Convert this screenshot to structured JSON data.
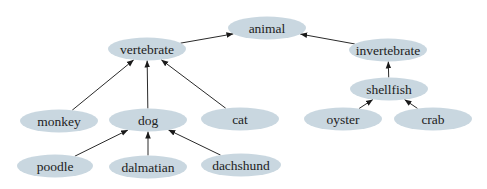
{
  "diagram": {
    "type": "tree",
    "direction": "child-to-parent arrows",
    "colors": {
      "node_fill": "#c9d7e0",
      "edge": "#2a2a2a",
      "text": "#222222",
      "background": "#ffffff"
    },
    "nodes": {
      "animal": {
        "label": "animal",
        "cx": 267,
        "cy": 28,
        "rx": 39,
        "ry": 11.5
      },
      "vertebrate": {
        "label": "vertebrate",
        "cx": 147,
        "cy": 49,
        "rx": 39,
        "ry": 11.5
      },
      "invertebrate": {
        "label": "invertebrate",
        "cx": 388,
        "cy": 50,
        "rx": 39,
        "ry": 11.5
      },
      "shellfish": {
        "label": "shellfish",
        "cx": 389,
        "cy": 89,
        "rx": 39,
        "ry": 11.5
      },
      "monkey": {
        "label": "monkey",
        "cx": 59,
        "cy": 121,
        "rx": 39,
        "ry": 11.5
      },
      "dog": {
        "label": "dog",
        "cx": 148,
        "cy": 120,
        "rx": 39,
        "ry": 11.5
      },
      "cat": {
        "label": "cat",
        "cx": 240,
        "cy": 119,
        "rx": 39,
        "ry": 11.5
      },
      "oyster": {
        "label": "oyster",
        "cx": 343,
        "cy": 119,
        "rx": 39,
        "ry": 11.5
      },
      "crab": {
        "label": "crab",
        "cx": 433,
        "cy": 119,
        "rx": 39,
        "ry": 11.5
      },
      "poodle": {
        "label": "poodle",
        "cx": 55,
        "cy": 166,
        "rx": 38,
        "ry": 11.5
      },
      "dalmatian": {
        "label": "dalmatian",
        "cx": 148,
        "cy": 167,
        "rx": 39,
        "ry": 11.5
      },
      "dachshund": {
        "label": "dachshund",
        "cx": 241,
        "cy": 165,
        "rx": 40,
        "ry": 11.5
      }
    },
    "edges": [
      {
        "from": "vertebrate",
        "to": "animal"
      },
      {
        "from": "invertebrate",
        "to": "animal"
      },
      {
        "from": "shellfish",
        "to": "invertebrate"
      },
      {
        "from": "monkey",
        "to": "vertebrate"
      },
      {
        "from": "dog",
        "to": "vertebrate"
      },
      {
        "from": "cat",
        "to": "vertebrate"
      },
      {
        "from": "oyster",
        "to": "shellfish"
      },
      {
        "from": "crab",
        "to": "shellfish"
      },
      {
        "from": "poodle",
        "to": "dog"
      },
      {
        "from": "dalmatian",
        "to": "dog"
      },
      {
        "from": "dachshund",
        "to": "dog"
      }
    ]
  }
}
